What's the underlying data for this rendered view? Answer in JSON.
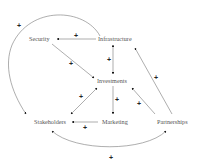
{
  "diagram": {
    "type": "causal-loop",
    "nodes": {
      "security": "Security",
      "infrastructure": "Infrastructure",
      "investments": "Investments",
      "stakeholders": "Stakeholders",
      "marketing": "Marketing",
      "partnerships": "Partnerships"
    },
    "edges": [
      {
        "from": "Infrastructure",
        "to": "Security",
        "polarity": "+"
      },
      {
        "from": "Security",
        "to": "Investments",
        "polarity": "+"
      },
      {
        "from": "Infrastructure",
        "to": "Investments",
        "polarity": "+",
        "bidirectional": true
      },
      {
        "from": "Infrastructure",
        "to": "Stakeholders",
        "polarity": "+",
        "curved": true
      },
      {
        "from": "Partnerships",
        "to": "Infrastructure",
        "polarity": "+"
      },
      {
        "from": "Partnerships",
        "to": "Investments",
        "polarity": "+"
      },
      {
        "from": "Investments",
        "to": "Marketing",
        "polarity": "+"
      },
      {
        "from": "Marketing",
        "to": "Stakeholders",
        "polarity": "+"
      },
      {
        "from": "Stakeholders",
        "to": "Investments",
        "polarity": "+",
        "bidirectional": true
      },
      {
        "from": "Stakeholders",
        "to": "Partnerships",
        "polarity": "+",
        "bidirectional": true,
        "curved": true
      }
    ],
    "polarity_symbol": "+",
    "colors": {
      "line": "#777777",
      "label": "#555555",
      "arrowhead": "#111111"
    }
  }
}
